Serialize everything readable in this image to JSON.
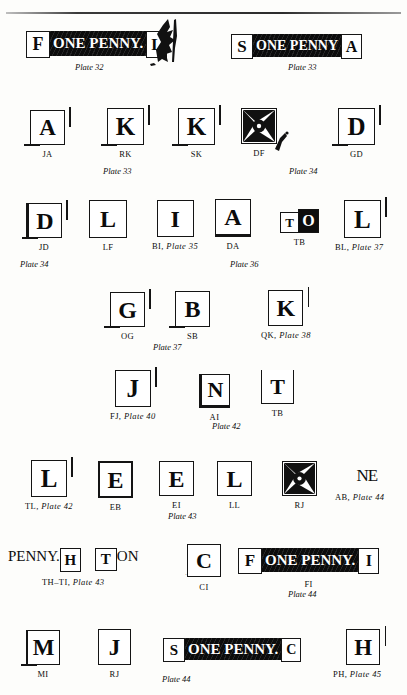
{
  "page": {
    "background_color": "#fdfdfb",
    "ink_color": "#0d0d0d",
    "width": 407,
    "height": 695
  },
  "rows": [
    {
      "row_id": "row-1",
      "items": [
        {
          "id": "p32",
          "kind": "strip",
          "box_letter": "F",
          "band_text": "ONE PENNY.",
          "end_letter": "L",
          "caption": "",
          "plate": "Plate 32",
          "plate_prefix": "",
          "torn_edge": true
        },
        {
          "id": "p33",
          "kind": "strip",
          "box_letter": "S",
          "band_text": "ONE PENNY",
          "end_letter": "A",
          "caption": "",
          "plate": "Plate 33",
          "plate_prefix": "",
          "torn_edge": false
        }
      ]
    },
    {
      "row_id": "row-2",
      "items": [
        {
          "id": "ja",
          "kind": "square",
          "glyph": "A",
          "caption": "JA"
        },
        {
          "id": "rk",
          "kind": "square",
          "glyph": "K",
          "caption": "RK",
          "plate": "Plate 33"
        },
        {
          "id": "sk",
          "kind": "square",
          "glyph": "K",
          "caption": "SK"
        },
        {
          "id": "df",
          "kind": "cross",
          "glyph": "",
          "caption": "DF"
        },
        {
          "id": "gd",
          "kind": "square",
          "glyph": "D",
          "caption": "GD"
        }
      ],
      "floating_plate": "Plate 34"
    },
    {
      "row_id": "row-3",
      "items": [
        {
          "id": "jd",
          "kind": "square",
          "glyph": "D",
          "caption": "JD"
        },
        {
          "id": "lf",
          "kind": "square",
          "glyph": "L",
          "caption": "LF"
        },
        {
          "id": "bi",
          "kind": "square",
          "glyph": "I",
          "caption": "BI,",
          "plate": "Plate 35"
        },
        {
          "id": "da",
          "kind": "square",
          "glyph": "A",
          "caption": "DA"
        },
        {
          "id": "tb1",
          "kind": "pair",
          "glyph": "T",
          "glyph2": "O",
          "caption": "TB"
        },
        {
          "id": "bl",
          "kind": "square",
          "glyph": "L",
          "caption": "BL,",
          "plate": "Plate 37"
        }
      ],
      "floating_plates": [
        "Plate 34",
        "Plate 36"
      ]
    },
    {
      "row_id": "row-4",
      "items": [
        {
          "id": "og",
          "kind": "square",
          "glyph": "G",
          "caption": "OG"
        },
        {
          "id": "sb",
          "kind": "square",
          "glyph": "B",
          "caption": "SB"
        },
        {
          "id": "qk",
          "kind": "square",
          "glyph": "K",
          "caption": "QK,",
          "plate": "Plate 38"
        }
      ],
      "floating_plate": "Plate 37"
    },
    {
      "row_id": "row-5",
      "items": [
        {
          "id": "fj",
          "kind": "square",
          "glyph": "J",
          "caption": "FJ,",
          "plate": "Plate 40"
        },
        {
          "id": "ai",
          "kind": "square",
          "glyph": "N",
          "caption": "AI"
        },
        {
          "id": "tb2",
          "kind": "square",
          "glyph": "T",
          "caption": "TB"
        }
      ],
      "floating_plate": "Plate 42"
    },
    {
      "row_id": "row-6",
      "items": [
        {
          "id": "tl",
          "kind": "square",
          "glyph": "L",
          "caption": "TL,",
          "plate": "Plate 42"
        },
        {
          "id": "eb",
          "kind": "square",
          "glyph": "E",
          "caption": "EB"
        },
        {
          "id": "ei",
          "kind": "square",
          "glyph": "E",
          "caption": "EI"
        },
        {
          "id": "ll",
          "kind": "square",
          "glyph": "L",
          "caption": "LL"
        },
        {
          "id": "rj",
          "kind": "cross",
          "glyph": "",
          "caption": "RJ"
        },
        {
          "id": "ab",
          "kind": "band",
          "glyph": "NE",
          "caption": "AB,",
          "plate": "Plate 44"
        }
      ],
      "floating_plate": "Plate 43"
    },
    {
      "row_id": "row-7",
      "items": [
        {
          "id": "thti",
          "kind": "strip2",
          "band_text": "PENNY.",
          "box_letter": "H",
          "caption": "TH–TI,",
          "plate": "Plate 43",
          "second_box": "T",
          "second_band": "ON"
        },
        {
          "id": "ci",
          "kind": "square",
          "glyph": "C",
          "caption": "CI"
        },
        {
          "id": "fi",
          "kind": "strip",
          "box_letter": "F",
          "band_text": "ONE PENNY.",
          "end_letter": "I",
          "caption": "FI"
        }
      ],
      "floating_plate": "Plate 44"
    },
    {
      "row_id": "row-8",
      "items": [
        {
          "id": "mi",
          "kind": "square",
          "glyph": "M",
          "caption": "MI"
        },
        {
          "id": "rj2",
          "kind": "square",
          "glyph": "J",
          "caption": "RJ"
        },
        {
          "id": "sc",
          "kind": "strip",
          "box_letter": "S",
          "band_text": "ONE PENNY.",
          "end_letter": "C",
          "caption": ""
        },
        {
          "id": "ph",
          "kind": "square",
          "glyph": "H",
          "caption": "PH,",
          "plate": "Plate 45"
        }
      ],
      "floating_plate": "Plate 44"
    }
  ]
}
